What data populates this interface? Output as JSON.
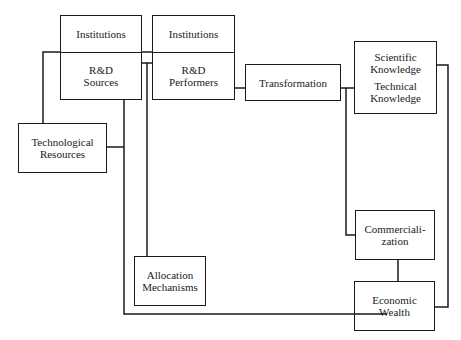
{
  "diagram": {
    "type": "block-flow",
    "line_color": "#1a1a1a",
    "background": "#ffffff",
    "nodes": {
      "rd_sources": {
        "top": "Institutions",
        "line1": "R&D",
        "line2": "Sources"
      },
      "rd_performers": {
        "top": "Institutions",
        "line1": "R&D",
        "line2": "Performers"
      },
      "technological_resources": {
        "line1": "Technological",
        "line2": "Resources"
      },
      "transformation": {
        "line1": "Transformation"
      },
      "knowledge": {
        "line1": "Scientific",
        "line2": "Knowledge",
        "line3": "Technical",
        "line4": "Knowledge"
      },
      "commercialization": {
        "line1": "Commerciali-",
        "line2": "zation"
      },
      "allocation_mechanisms": {
        "line1": "Allocation",
        "line2": "Mechanisms"
      },
      "economic_wealth": {
        "line1": "Economic",
        "line2": "Wealth"
      }
    },
    "connections": [
      [
        "technological_resources",
        "rd_sources"
      ],
      [
        "technological_resources",
        "economic_wealth"
      ],
      [
        "rd_sources",
        "rd_performers"
      ],
      [
        "rd_sources",
        "allocation_mechanisms"
      ],
      [
        "rd_performers",
        "transformation"
      ],
      [
        "transformation",
        "knowledge"
      ],
      [
        "transformation",
        "commercialization"
      ],
      [
        "knowledge",
        "economic_wealth"
      ],
      [
        "commercialization",
        "economic_wealth"
      ]
    ]
  }
}
